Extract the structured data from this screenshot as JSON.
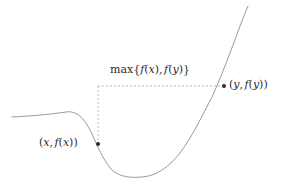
{
  "figure": {
    "name": "max-of-two-function-values-diagram",
    "width": 287,
    "height": 188,
    "background_color": "#ffffff"
  },
  "curve": {
    "name": "function-curve",
    "color": "#9a9a9a",
    "stroke_width": 1,
    "description": "smooth curve: flat plateau on left, sigmoidal drop to a shallow valley, then steep rise to upper right"
  },
  "guides": {
    "color": "#b9b9b9",
    "stroke_width": 1,
    "dash": "2,2",
    "vertical": {
      "name": "vertical-dashed-guide",
      "x": 98,
      "y_top": 86,
      "y_bottom": 144
    },
    "horizontal": {
      "name": "horizontal-dashed-guide",
      "y": 86,
      "x_left": 98,
      "x_right": 224
    }
  },
  "points": [
    {
      "name": "point-x-fx",
      "x": 98,
      "y": 144,
      "color": "#2b2b2b",
      "radius": 2
    },
    {
      "name": "point-y-fy",
      "x": 224,
      "y": 86,
      "color": "#2b2b2b",
      "radius": 2
    }
  ],
  "labels": {
    "max_label": {
      "name": "max-label",
      "text": "max{f(x), f(y)}",
      "parts": {
        "op": "max",
        "open_brace": "{",
        "f1": "f",
        "open1": "(",
        "var1": "x",
        "close1": ")",
        "comma": ",",
        "f2": "f",
        "open2": "(",
        "var2": "y",
        "close2": ")",
        "close_brace": "}"
      }
    },
    "left_point_label": {
      "name": "point-x-fx-label",
      "text": "(x, f(x))",
      "parts": {
        "open": "(",
        "var": "x",
        "comma": ",",
        "f": "f",
        "open2": "(",
        "var2": "x",
        "close2": ")",
        "close": ")"
      }
    },
    "right_point_label": {
      "name": "point-y-fy-label",
      "text": "(y, f(y))",
      "parts": {
        "open": "(",
        "var": "y",
        "comma": ",",
        "f": "f",
        "open2": "(",
        "var2": "y",
        "close2": ")",
        "close": ")"
      }
    }
  }
}
